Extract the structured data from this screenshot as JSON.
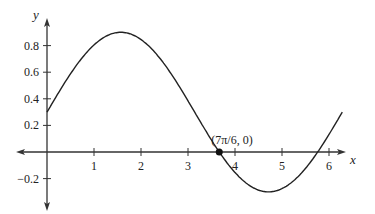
{
  "chart_data": {
    "type": "line",
    "title": "",
    "xlabel": "x",
    "ylabel": "y",
    "function": "y = 0.6 sin(x) + 0.3",
    "xlim": [
      0,
      6.283
    ],
    "ylim": [
      -0.3,
      0.9
    ],
    "x_ticks": [
      "1",
      "2",
      "3",
      "4",
      "5",
      "6"
    ],
    "y_ticks": [
      "0.8",
      "0.6",
      "0.4",
      "0.2",
      "-0.2"
    ],
    "x_tick_values": [
      1,
      2,
      3,
      4,
      5,
      6
    ],
    "y_tick_values": [
      0.8,
      0.6,
      0.4,
      0.2,
      -0.2
    ],
    "annotations": [
      {
        "label": "(7π/6, 0)",
        "x": 3.665,
        "y": 0
      }
    ],
    "grid": false,
    "series": [
      {
        "name": "f(x)",
        "x_range": [
          0,
          6.283
        ],
        "amplitude": 0.6,
        "shift": 0.3
      }
    ]
  }
}
